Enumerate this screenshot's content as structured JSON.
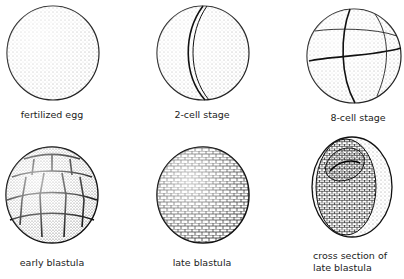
{
  "figure": {
    "stages": [
      {
        "id": "fertilized-egg",
        "label": "fertilized egg"
      },
      {
        "id": "2-cell",
        "label": "2-cell stage"
      },
      {
        "id": "8-cell",
        "label": "8-cell stage"
      },
      {
        "id": "early-blastula",
        "label": "early blastula"
      },
      {
        "id": "late-blastula",
        "label": "late blastula"
      },
      {
        "id": "cross-section",
        "label_line1": "cross section of",
        "label_line2": "late blastula"
      }
    ]
  }
}
